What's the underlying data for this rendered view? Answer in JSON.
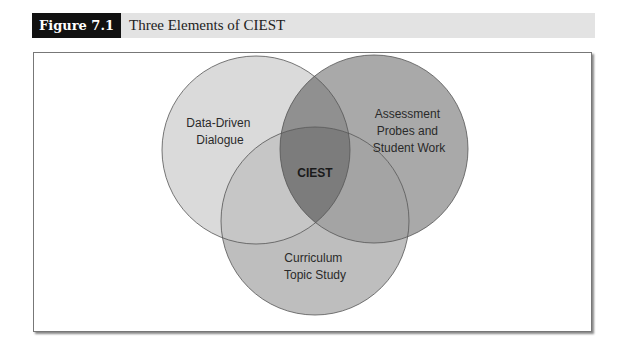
{
  "header": {
    "figure_label": "Figure 7.1",
    "title": "Three Elements of CIEST"
  },
  "diagram": {
    "type": "venn",
    "center_label": "CIEST",
    "sets": [
      {
        "name": "left",
        "lines": [
          "Data-Driven",
          "Dialogue"
        ],
        "color": "#d9d9d9"
      },
      {
        "name": "right",
        "lines": [
          "Assessment",
          "Probes and",
          "Student Work"
        ],
        "color": "#a8a8a8"
      },
      {
        "name": "bottom",
        "lines": [
          "Curriculum",
          "Topic Study"
        ],
        "color": "#bdbdbd"
      }
    ],
    "overlap_colors": {
      "left_right": "#8f8f8f",
      "left_bottom": "#c4c4c4",
      "right_bottom": "#a3a3a3",
      "all": "#7a7a7a"
    },
    "outline_color": "#555555"
  }
}
